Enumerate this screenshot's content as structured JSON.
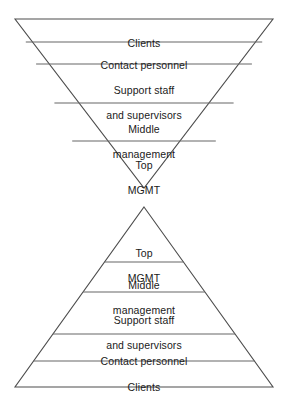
{
  "diagram": {
    "type": "dual-pyramid-organizational-diagram",
    "background_color": "#ffffff",
    "line_color": "#4d4d4d",
    "text_color": "#1a1a1a",
    "inverted_pyramid": {
      "name": "inverted-pyramid",
      "orientation": "inverted",
      "layers": [
        {
          "label": "Clients",
          "lines": [
            "Clients"
          ]
        },
        {
          "label": "Contact personnel",
          "lines": [
            "Contact personnel"
          ]
        },
        {
          "label": "Support staff and supervisors",
          "lines": [
            "Support staff",
            "and supervisors"
          ]
        },
        {
          "label": "Middle management",
          "lines": [
            "Middle",
            "management"
          ]
        },
        {
          "label": "Top MGMT",
          "lines": [
            "Top",
            "MGMT"
          ]
        }
      ]
    },
    "upright_pyramid": {
      "name": "upright-pyramid",
      "orientation": "upright",
      "layers": [
        {
          "label": "Top MGMT",
          "lines": [
            "Top",
            "MGMT"
          ]
        },
        {
          "label": "Middle management",
          "lines": [
            "Middle",
            "management"
          ]
        },
        {
          "label": "Support staff and supervisors",
          "lines": [
            "Support staff",
            "and supervisors"
          ]
        },
        {
          "label": "Contact personnel",
          "lines": [
            "Contact personnel"
          ]
        },
        {
          "label": "Clients",
          "lines": [
            "Clients"
          ]
        }
      ]
    }
  },
  "labels": {
    "inv_l1_a": "Clients",
    "inv_l2_a": "Contact personnel",
    "inv_l3_a": "Support staff",
    "inv_l3_b": "and supervisors",
    "inv_l4_a": "Middle",
    "inv_l4_b": "management",
    "inv_l5_a": "Top",
    "inv_l5_b": "MGMT",
    "up_l1_a": "Top",
    "up_l1_b": "MGMT",
    "up_l2_a": "Middle",
    "up_l2_b": "management",
    "up_l3_a": "Support staff",
    "up_l3_b": "and supervisors",
    "up_l4_a": "Contact personnel",
    "up_l5_a": "Clients"
  }
}
